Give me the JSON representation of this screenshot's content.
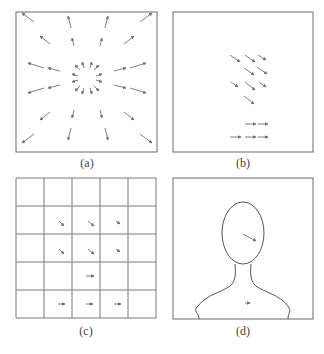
{
  "colors": {
    "frame": "#6b6b6b",
    "grid": "#7a7a7a",
    "arrow": "#707070",
    "outline": "#555555",
    "label": "#444444"
  },
  "panels": [
    {
      "id": "a",
      "label": "(a)",
      "description": "radial flow field: arrows pointing outward from center",
      "box": [
        16,
        12,
        141,
        140
      ],
      "label_pos": [
        56,
        156
      ]
    },
    {
      "id": "b",
      "label": "(b)",
      "description": "sparse flow vectors: diagonal arrows in upper middle, horizontal arrows near bottom",
      "box": [
        173,
        12,
        140,
        140
      ],
      "label_pos": [
        213,
        156
      ]
    },
    {
      "id": "c",
      "label": "(c)",
      "description": "5x5 grid with block-averaged motion vectors",
      "box": [
        16,
        178,
        140,
        140
      ],
      "grid": {
        "rows": 5,
        "cols": 5
      },
      "label_pos": [
        56,
        324
      ]
    },
    {
      "id": "d",
      "label": "(d)",
      "description": "head-and-shoulders silhouette with one arrow on face and one on chest",
      "box": [
        173,
        178,
        140,
        141
      ],
      "label_pos": [
        213,
        324
      ]
    }
  ],
  "arrows": {
    "a": [
      [
        34,
        22,
        22,
        13
      ],
      [
        71,
        28,
        68,
        16
      ],
      [
        105,
        28,
        108,
        16
      ],
      [
        140,
        22,
        152,
        13
      ],
      [
        50,
        44,
        40,
        36
      ],
      [
        74,
        46,
        72,
        38
      ],
      [
        100,
        46,
        102,
        38
      ],
      [
        124,
        44,
        134,
        36
      ],
      [
        44,
        68,
        28,
        63
      ],
      [
        60,
        71,
        48,
        68
      ],
      [
        114,
        71,
        126,
        68
      ],
      [
        130,
        68,
        146,
        63
      ],
      [
        44,
        88,
        28,
        93
      ],
      [
        60,
        85,
        48,
        88
      ],
      [
        114,
        85,
        126,
        88
      ],
      [
        130,
        88,
        146,
        93
      ],
      [
        50,
        112,
        40,
        120
      ],
      [
        74,
        110,
        72,
        118
      ],
      [
        100,
        110,
        102,
        118
      ],
      [
        124,
        112,
        134,
        120
      ],
      [
        34,
        134,
        22,
        143
      ],
      [
        71,
        128,
        68,
        140
      ],
      [
        105,
        128,
        108,
        140
      ],
      [
        140,
        134,
        152,
        143
      ],
      [
        80,
        70,
        75,
        65
      ],
      [
        84,
        68,
        82,
        62
      ],
      [
        90,
        68,
        92,
        62
      ],
      [
        94,
        70,
        99,
        65
      ],
      [
        78,
        76,
        72,
        74
      ],
      [
        96,
        76,
        102,
        74
      ],
      [
        78,
        80,
        72,
        82
      ],
      [
        96,
        80,
        102,
        82
      ],
      [
        80,
        86,
        75,
        91
      ],
      [
        84,
        88,
        82,
        94
      ],
      [
        90,
        88,
        92,
        94
      ],
      [
        94,
        86,
        99,
        91
      ]
    ],
    "b": [
      [
        230,
        55,
        240,
        62
      ],
      [
        245,
        55,
        255,
        62
      ],
      [
        258,
        55,
        266,
        60
      ],
      [
        244,
        68,
        254,
        75
      ],
      [
        257,
        67,
        267,
        74
      ],
      [
        231,
        82,
        238,
        87
      ],
      [
        245,
        82,
        255,
        90
      ],
      [
        259,
        82,
        266,
        87
      ],
      [
        244,
        96,
        254,
        104
      ],
      [
        245,
        124,
        256,
        124
      ],
      [
        258,
        124,
        268,
        124
      ],
      [
        230,
        137,
        241,
        137
      ],
      [
        245,
        137,
        256,
        137
      ],
      [
        258,
        137,
        268,
        137
      ]
    ],
    "c": [
      [
        59,
        221,
        64,
        226
      ],
      [
        88,
        221,
        94,
        226
      ],
      [
        116,
        221,
        120,
        224
      ],
      [
        59,
        249,
        64,
        254
      ],
      [
        88,
        249,
        94,
        254
      ],
      [
        116,
        249,
        120,
        252
      ],
      [
        86,
        276,
        94,
        276
      ],
      [
        58,
        304,
        65,
        304
      ],
      [
        86,
        304,
        93,
        304
      ],
      [
        114,
        304,
        121,
        304
      ]
    ],
    "d": [
      [
        243,
        234,
        256,
        241
      ],
      [
        245,
        303,
        250,
        303
      ]
    ]
  }
}
